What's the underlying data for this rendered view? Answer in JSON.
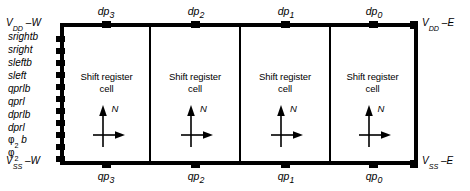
{
  "figure": {
    "cell_count": 4,
    "colors": {
      "ink": "#000000",
      "background": "#ffffff"
    }
  },
  "cells": [
    {
      "label_line1": "Shift register",
      "label_line2": "cell",
      "orientation_marker": "N"
    },
    {
      "label_line1": "Shift register",
      "label_line2": "cell",
      "orientation_marker": "N"
    },
    {
      "label_line1": "Shift register",
      "label_line2": "cell",
      "orientation_marker": "N"
    },
    {
      "label_line1": "Shift register",
      "label_line2": "cell",
      "orientation_marker": "N"
    }
  ],
  "top_ports": [
    {
      "base": "dp",
      "subscript": "3"
    },
    {
      "base": "dp",
      "subscript": "2"
    },
    {
      "base": "dp",
      "subscript": "1"
    },
    {
      "base": "dp",
      "subscript": "0"
    }
  ],
  "bottom_ports": [
    {
      "base": "qp",
      "subscript": "3"
    },
    {
      "base": "qp",
      "subscript": "2"
    },
    {
      "base": "qp",
      "subscript": "1"
    },
    {
      "base": "qp",
      "subscript": "0"
    }
  ],
  "power_rails": {
    "top_left": {
      "base": "V",
      "subscript": "DD",
      "suffix": " –W"
    },
    "bottom_left": {
      "base": "V",
      "subscript": "SS",
      "suffix": " –W"
    },
    "top_right": {
      "base": "V",
      "subscript": "DD",
      "suffix": " –E"
    },
    "bottom_right": {
      "base": "V",
      "subscript": "SS",
      "suffix": " –E"
    }
  },
  "left_signals": [
    {
      "name": "srightb",
      "subscript": ""
    },
    {
      "name": "sright",
      "subscript": ""
    },
    {
      "name": "sleftb",
      "subscript": ""
    },
    {
      "name": "sleft",
      "subscript": ""
    },
    {
      "name": "qprlb",
      "subscript": ""
    },
    {
      "name": "qprl",
      "subscript": ""
    },
    {
      "name": "dprlb",
      "subscript": ""
    },
    {
      "name": "dprl",
      "subscript": ""
    },
    {
      "name": "φ",
      "subscript": "2",
      "suffix": " b"
    },
    {
      "name": "φ",
      "subscript": "2",
      "suffix": ""
    }
  ]
}
